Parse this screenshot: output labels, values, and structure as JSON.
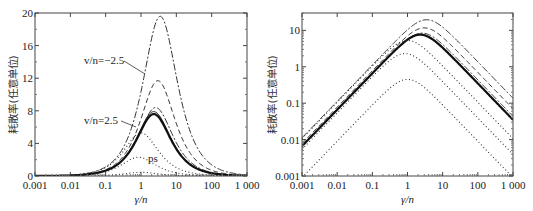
{
  "chart_data": [
    {
      "type": "line",
      "title": "",
      "xscale": "log",
      "yscale": "linear",
      "xlabel": "γ/n",
      "ylabel": "耗散率(任意单位)",
      "xlim": [
        0.001,
        1000
      ],
      "ylim": [
        0,
        20
      ],
      "xticks": [
        "0.001",
        "0.01",
        "0.1",
        "1",
        "10",
        "100",
        "1 000"
      ],
      "yticks": [
        "0",
        "4",
        "8",
        "12",
        "16",
        "20"
      ],
      "annotations": [
        "v/n=−2.5",
        "v/n=2.5",
        "ps"
      ],
      "series": [
        {
          "name": "v/n=-2.5 (dash-dot)",
          "style": "dashdot",
          "peak_x": 3.5,
          "peak_y": 19.6
        },
        {
          "name": "dashed",
          "style": "dashed",
          "peak_x": 3.0,
          "peak_y": 11.7
        },
        {
          "name": "dash-dot 2",
          "style": "dashdot",
          "peak_x": 2.6,
          "peak_y": 8.4
        },
        {
          "name": "v/n=2.5 (solid)",
          "style": "solid",
          "peak_x": 2.3,
          "peak_y": 7.9
        },
        {
          "name": "solid thick",
          "style": "solid-thick",
          "peak_x": 2.3,
          "peak_y": 7.6
        },
        {
          "name": "dotted 1",
          "style": "dotted",
          "peak_x": 1.0,
          "peak_y": 5.3
        },
        {
          "name": "ps (dotted)",
          "style": "dotted",
          "peak_x": 0.85,
          "peak_y": 2.3
        },
        {
          "name": "dotted 3",
          "style": "dotted",
          "peak_x": 1.0,
          "peak_y": 0.45
        }
      ],
      "grid": false,
      "legend": "none"
    },
    {
      "type": "line",
      "title": "",
      "xscale": "log",
      "yscale": "log",
      "xlabel": "γ/n",
      "ylabel": "耗散率(任意单位)",
      "xlim": [
        0.001,
        1000
      ],
      "ylim": [
        0.001,
        30
      ],
      "xticks": [
        "0.001",
        "0.01",
        "0.1",
        "1",
        "10",
        "100",
        "1 000"
      ],
      "yticks": [
        "0.001",
        "0.01",
        "0.1",
        "1",
        "10"
      ],
      "series": [
        {
          "name": "dash-dot",
          "style": "dashdot",
          "peak_x": 3.5,
          "peak_y": 19.6
        },
        {
          "name": "dashed",
          "style": "dashed",
          "peak_x": 3.0,
          "peak_y": 11.7
        },
        {
          "name": "dash-dot 2",
          "style": "dashdot",
          "peak_x": 2.6,
          "peak_y": 8.4
        },
        {
          "name": "solid",
          "style": "solid",
          "peak_x": 2.3,
          "peak_y": 7.9
        },
        {
          "name": "solid thick",
          "style": "solid-thick",
          "peak_x": 2.3,
          "peak_y": 7.6
        },
        {
          "name": "dotted 1",
          "style": "dotted",
          "peak_x": 1.0,
          "peak_y": 5.3
        },
        {
          "name": "dotted 2",
          "style": "dotted",
          "peak_x": 0.85,
          "peak_y": 2.3
        },
        {
          "name": "dotted 3",
          "style": "dotted",
          "peak_x": 1.0,
          "peak_y": 0.45
        }
      ],
      "grid": false,
      "legend": "none"
    }
  ]
}
